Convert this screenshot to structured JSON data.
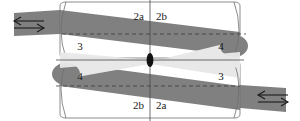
{
  "figure": {
    "type": "technical-diagram",
    "background_color": "#ffffff",
    "band_color": "#808080",
    "bowtie_color": "#e8e8e8",
    "outline_color": "#6e6e6e",
    "axis_color": "#4a4a4a",
    "center_marker_color": "#111111",
    "label_color": "#1a1a1a"
  },
  "labels": {
    "top_left": "2a",
    "top_right": "2b",
    "bottom_left": "2b",
    "bottom_right": "2a",
    "upper_left": "3",
    "upper_right": "4",
    "lower_left": "4",
    "lower_right": "3"
  },
  "arrows": {
    "upper_left": "double-headed-arrow",
    "lower_right": "double-headed-arrow"
  },
  "center_marker": {
    "name": "center-ellipse"
  }
}
